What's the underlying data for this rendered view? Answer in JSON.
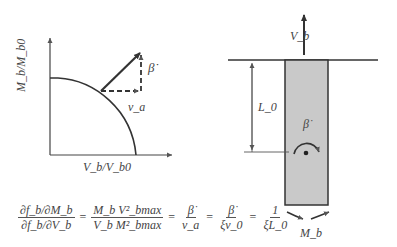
{
  "left_plot": {
    "y_axis_label": "M_b/M_b0",
    "x_axis_label": "V_b/V_b0",
    "vector_labels": {
      "vertical_component": "β̇",
      "horizontal_component": "v_a"
    }
  },
  "equation": {
    "terms": [
      {
        "num": "∂f_b/∂M_b",
        "den": "∂f_b/∂V_b"
      },
      {
        "num": "M_b V²_bmax",
        "den": "V_b M²_bmax"
      },
      {
        "num": "β̇",
        "den": "v_a"
      },
      {
        "num": "β̇",
        "den": "ξv_0"
      },
      {
        "num": "1",
        "den": "ξL_0"
      }
    ],
    "operator": "="
  },
  "right_diagram": {
    "force_label": "V_b",
    "length_label": "L_0",
    "rotation_label": "β̇",
    "moment_label": "M_b"
  },
  "colors": {
    "line": "#333333",
    "pile_fill": "#c9c9c9",
    "text": "#444444"
  }
}
